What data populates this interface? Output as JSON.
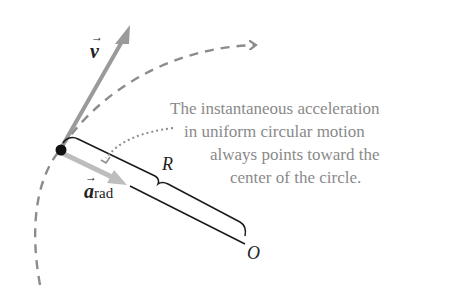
{
  "diagram": {
    "type": "physics-uniform-circular-motion",
    "labels": {
      "velocity": "v",
      "acceleration": "a",
      "acceleration_subscript": "rad",
      "radius": "R",
      "center": "O"
    },
    "caption": {
      "line1": "The instantaneous acceleration",
      "line2": "in uniform circular motion",
      "line3": "always points toward the",
      "line4": "center of the circle."
    },
    "colors": {
      "path": "#8c8c8c",
      "velocity_arrow": "#9a9a9a",
      "acceleration_arrow": "#bdbdbd",
      "radius_line": "#1a1a1a",
      "point": "#111111",
      "caption_text": "#8a8a8a"
    }
  }
}
